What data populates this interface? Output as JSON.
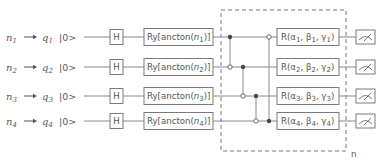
{
  "diagram": {
    "type": "quantum-circuit",
    "qubits": [
      {
        "input": "n",
        "input_sub": "1",
        "qubit": "q",
        "qubit_sub": "1",
        "init": "|0>",
        "h_gate": "H",
        "ry_prefix": "Ry[ancton(",
        "ry_var": "n",
        "ry_sub": "1",
        "ry_suffix": ")]",
        "rot_prefix": "R(α",
        "rot_sub_a": "1",
        "rot_b": ", β",
        "rot_sub_b": "1",
        "rot_c": ", γ",
        "rot_sub_c": "1",
        "rot_suffix": ")"
      },
      {
        "input": "n",
        "input_sub": "2",
        "qubit": "q",
        "qubit_sub": "2",
        "init": "|0>",
        "h_gate": "H",
        "ry_prefix": "Ry[ancton(",
        "ry_var": "n",
        "ry_sub": "2",
        "ry_suffix": ")]",
        "rot_prefix": "R(α",
        "rot_sub_a": "2",
        "rot_b": ", β",
        "rot_sub_b": "2",
        "rot_c": ", γ",
        "rot_sub_c": "2",
        "rot_suffix": ")"
      },
      {
        "input": "n",
        "input_sub": "3",
        "qubit": "q",
        "qubit_sub": "3",
        "init": "|0>",
        "h_gate": "H",
        "ry_prefix": "Ry[ancton(",
        "ry_var": "n",
        "ry_sub": "3",
        "ry_suffix": ")]",
        "rot_prefix": "R(α",
        "rot_sub_a": "3",
        "rot_b": ", β",
        "rot_sub_b": "3",
        "rot_c": ", γ",
        "rot_sub_c": "3",
        "rot_suffix": ")"
      },
      {
        "input": "n",
        "input_sub": "4",
        "qubit": "q",
        "qubit_sub": "4",
        "init": "|0>",
        "h_gate": "H",
        "ry_prefix": "Ry[ancton(",
        "ry_var": "n",
        "ry_sub": "4",
        "ry_suffix": ")]",
        "rot_prefix": "R(α",
        "rot_sub_a": "4",
        "rot_b": ", β",
        "rot_sub_b": "4",
        "rot_c": ", γ",
        "rot_sub_c": "4",
        "rot_suffix": ")"
      }
    ],
    "entangling_cnots": [
      {
        "control": 1,
        "target": 2
      },
      {
        "control": 2,
        "target": 3
      },
      {
        "control": 3,
        "target": 4
      },
      {
        "control": 4,
        "target": 1
      }
    ],
    "repeat_block_label": "n",
    "measurement_icon": "meter-icon"
  }
}
